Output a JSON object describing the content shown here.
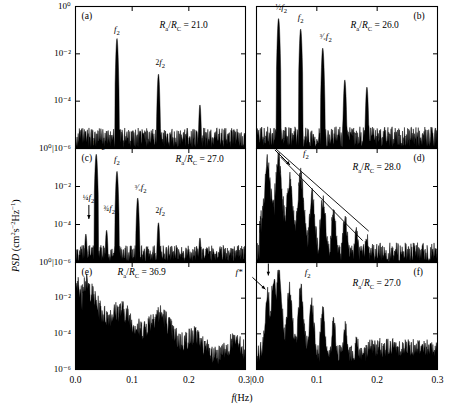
{
  "figure": {
    "axes": {
      "xlabel_italic": "f",
      "xlabel_unit": "(Hz)",
      "ylabel_italic": "PSD",
      "ylabel_unit_pre": " (cm",
      "ylabel_unit_mid": "s",
      "ylabel_unit_end": "Hz",
      "x_ticks_left": [
        "0.0",
        "0.1",
        "0.2"
      ],
      "x_tick_shared": "0.3|0.0",
      "x_ticks_right": [
        "0.1",
        "0.2",
        "0.3"
      ],
      "x_min": 0.0,
      "x_max": 0.3,
      "y_min_exp": -6,
      "y_max_exp": 0,
      "y_ticks_top": [
        "10⁰",
        "10⁻²",
        "10⁻⁴"
      ],
      "y_tick_shared": "10⁰|10⁻⁶",
      "y_ticks_bottom": [
        "10⁻²",
        "10⁻⁴",
        "10⁻⁶"
      ]
    },
    "panels": [
      {
        "id": "a",
        "letter": "(a)",
        "letter_side": "left",
        "ratio_label": "R_a/R_C = 21.0",
        "ratio_value": "21.0",
        "spectrum_type": "periodic",
        "base_frequency": 0.0732,
        "noise_floor_exp": -5.55,
        "peaks": [
          {
            "f": 0.0732,
            "exp": -1.35,
            "label": "f₂"
          },
          {
            "f": 0.1464,
            "exp": -2.85,
            "label": "2f₂"
          },
          {
            "f": 0.2196,
            "exp": -4.15,
            "label": ""
          }
        ],
        "peak_labels": [
          {
            "text_frac": "",
            "text_italic": "f",
            "text_sub": "2",
            "f": 0.0732,
            "exp": -0.95
          },
          {
            "text_frac": "2",
            "text_italic": "f",
            "text_sub": "2",
            "f": 0.1464,
            "exp": -2.35
          }
        ]
      },
      {
        "id": "b",
        "letter": "(b)",
        "letter_side": "right",
        "ratio_label": "R_a/R_C = 26.0",
        "ratio_value": "26.0",
        "spectrum_type": "period-2",
        "base_frequency": 0.0732,
        "noise_floor_exp": -5.5,
        "peaks": [
          {
            "f": 0.0366,
            "exp": -0.5,
            "label": "½f₂"
          },
          {
            "f": 0.0732,
            "exp": -0.95,
            "label": "f₂"
          },
          {
            "f": 0.1098,
            "exp": -1.75,
            "label": "³⁄₂f₂"
          },
          {
            "f": 0.1464,
            "exp": -3.1,
            "label": ""
          },
          {
            "f": 0.183,
            "exp": -3.4,
            "label": ""
          }
        ],
        "peak_labels": [
          {
            "text_frac": "½",
            "text_italic": "f",
            "text_sub": "2",
            "f": 0.0366,
            "exp": 0.0
          },
          {
            "text_frac": "",
            "text_italic": "f",
            "text_sub": "2",
            "f": 0.0732,
            "exp": -0.45
          },
          {
            "text_frac": "³⁄₂",
            "text_italic": "f",
            "text_sub": "2",
            "f": 0.1098,
            "exp": -1.25
          }
        ]
      },
      {
        "id": "c",
        "letter": "(c)",
        "letter_side": "left",
        "ratio_label": "R_a/R_C = 27.0",
        "ratio_value": "27.0",
        "spectrum_type": "period-4",
        "base_frequency": 0.0732,
        "noise_floor_exp": -5.5,
        "peaks": [
          {
            "f": 0.0183,
            "exp": -4.5,
            "label": "¼f₂"
          },
          {
            "f": 0.0366,
            "exp": -0.3,
            "label": "½f₂"
          },
          {
            "f": 0.0549,
            "exp": -4.3,
            "label": "¾f₂"
          },
          {
            "f": 0.0732,
            "exp": -1.2,
            "label": "f₂"
          },
          {
            "f": 0.1098,
            "exp": -2.6,
            "label": "³⁄₂f₂"
          },
          {
            "f": 0.1464,
            "exp": -3.9,
            "label": "2f₂"
          },
          {
            "f": 0.2196,
            "exp": -4.7,
            "label": ""
          }
        ],
        "peak_labels": [
          {
            "text_frac": "¼",
            "text_italic": "f",
            "text_sub": "2",
            "f": 0.0183,
            "exp": -2.55,
            "arrow": true
          },
          {
            "text_frac": "½",
            "text_italic": "f",
            "text_sub": "2",
            "f": 0.0366,
            "exp": 0.25
          },
          {
            "text_frac": "¾",
            "text_italic": "f",
            "text_sub": "2",
            "f": 0.0549,
            "exp": -3.15
          },
          {
            "text_frac": "",
            "text_italic": "f",
            "text_sub": "2",
            "f": 0.0732,
            "exp": -0.55
          },
          {
            "text_frac": "³⁄₂",
            "text_italic": "f",
            "text_sub": "2",
            "f": 0.1098,
            "exp": -2.0
          },
          {
            "text_frac": "2",
            "text_italic": "f",
            "text_sub": "2",
            "f": 0.1464,
            "exp": -3.25
          }
        ]
      },
      {
        "id": "d",
        "letter": "(d)",
        "letter_side": "right",
        "ratio_label": "R_a/R_C = 28.0",
        "ratio_value": "28.0",
        "spectrum_type": "chaotic-broadened",
        "base_frequency": 0.0366,
        "noise_floor_exp": -5.45,
        "peaks": [
          {
            "f": 0.0183,
            "exp": -0.7,
            "label": "¼f₂"
          },
          {
            "f": 0.0366,
            "exp": -0.5,
            "label": "½f₂"
          },
          {
            "f": 0.055,
            "exp": -1.6,
            "label": ""
          },
          {
            "f": 0.0732,
            "exp": -1.4,
            "label": "f₂"
          },
          {
            "f": 0.092,
            "exp": -2.5,
            "label": ""
          },
          {
            "f": 0.11,
            "exp": -2.7,
            "label": ""
          },
          {
            "f": 0.128,
            "exp": -3.4,
            "label": ""
          },
          {
            "f": 0.147,
            "exp": -3.7,
            "label": ""
          },
          {
            "f": 0.165,
            "exp": -4.3,
            "label": ""
          },
          {
            "f": 0.183,
            "exp": -4.6,
            "label": ""
          }
        ],
        "peak_labels": [
          {
            "text_frac": "¼",
            "text_italic": "f",
            "text_sub": "2",
            "f": 0.004,
            "exp": 0.4,
            "arrow": true
          },
          {
            "text_frac": "½",
            "text_italic": "f",
            "text_sub": "2",
            "f": 0.036,
            "exp": 0.4
          },
          {
            "text_frac": "",
            "text_italic": "f",
            "text_sub": "2",
            "f": 0.082,
            "exp": -0.25
          }
        ],
        "envelope_lines": [
          {
            "x1": 0.026,
            "y1": 0.15,
            "x2": 0.186,
            "y2": -4.35
          },
          {
            "x1": 0.04,
            "y1": -0.45,
            "x2": 0.176,
            "y2": -4.85
          }
        ]
      },
      {
        "id": "e",
        "letter": "(e)",
        "letter_side": "left",
        "ratio_label": "R_a/R_C = 36.9",
        "ratio_value": "36.9",
        "spectrum_type": "turbulent",
        "base_frequency": 0.0,
        "noise_floor_exp": -5.3,
        "peaks": [
          {
            "f": 0.04,
            "exp": -1.25,
            "label": ""
          }
        ],
        "peak_labels": []
      },
      {
        "id": "f",
        "letter": "(f)",
        "letter_side": "right",
        "ratio_label": "R_a/R_C = 27.0",
        "ratio_value": "27.0",
        "spectrum_type": "noisy-period-4",
        "base_frequency": 0.0732,
        "noise_floor_exp": -5.1,
        "peaks": [
          {
            "f": 0.0183,
            "exp": -1.7,
            "label": "¼f₂"
          },
          {
            "f": 0.0285,
            "exp": -0.9,
            "label": ""
          },
          {
            "f": 0.0366,
            "exp": -0.6,
            "label": "½f₂"
          },
          {
            "f": 0.0549,
            "exp": -1.5,
            "label": ""
          },
          {
            "f": 0.0732,
            "exp": -1.45,
            "label": "f₂"
          },
          {
            "f": 0.0915,
            "exp": -2.3,
            "label": ""
          },
          {
            "f": 0.11,
            "exp": -2.6,
            "label": ""
          },
          {
            "f": 0.128,
            "exp": -3.3,
            "label": ""
          },
          {
            "f": 0.147,
            "exp": -3.6,
            "label": ""
          },
          {
            "f": 0.166,
            "exp": -4.2,
            "label": ""
          }
        ],
        "peak_labels": [
          {
            "text_frac": "",
            "text_italic": "f*",
            "text_sub": "",
            "f": -0.03,
            "exp": -0.55,
            "arrow": true
          },
          {
            "text_frac": "¼",
            "text_italic": "f",
            "text_sub": "2",
            "f": 0.013,
            "exp": 0.45,
            "arrow": true
          },
          {
            "text_frac": "½",
            "text_italic": "f",
            "text_sub": "2",
            "f": 0.042,
            "exp": 0.45
          },
          {
            "text_frac": "",
            "text_italic": "f",
            "text_sub": "2",
            "f": 0.085,
            "exp": -0.55
          }
        ]
      }
    ]
  },
  "chart_data": {
    "type": "line",
    "title": "",
    "xlabel": "f (Hz)",
    "ylabel": "PSD (cm2 s-2 Hz-1)",
    "xlim": [
      0.0,
      0.3
    ],
    "ylim_log10": [
      -6,
      0
    ],
    "x_scale": "linear",
    "y_scale": "log",
    "grid": false,
    "legend": "none",
    "panel_count": 6,
    "panel_layout": "3 rows x 2 columns",
    "series": [
      {
        "name": "(a) Ra/Rc = 21.0",
        "description": "Single limit-cycle spectrum: sharp fundamental f2 with harmonics over flat noise floor",
        "noise_floor_log10": -5.55,
        "peak_frequencies_hz": [
          0.0732,
          0.1464,
          0.2196
        ],
        "peak_values_log10": [
          -1.35,
          -2.85,
          -4.15
        ],
        "labelled_peaks": [
          "f2",
          "2f2"
        ]
      },
      {
        "name": "(b) Ra/Rc = 26.0",
        "description": "Period-doubled spectrum: subharmonic 1/2 f2 appears, largest peak",
        "noise_floor_log10": -5.5,
        "peak_frequencies_hz": [
          0.0366,
          0.0732,
          0.1098,
          0.1464,
          0.183
        ],
        "peak_values_log10": [
          -0.5,
          -0.95,
          -1.75,
          -3.1,
          -3.4
        ],
        "labelled_peaks": [
          "1/2 f2",
          "f2",
          "3/2 f2"
        ]
      },
      {
        "name": "(c) Ra/Rc = 27.0",
        "description": "Period-4 spectrum: quarter subharmonics 1/4 f2 and 3/4 f2 present",
        "noise_floor_log10": -5.5,
        "peak_frequencies_hz": [
          0.0183,
          0.0366,
          0.0549,
          0.0732,
          0.1098,
          0.1464,
          0.2196
        ],
        "peak_values_log10": [
          -4.5,
          -0.3,
          -4.3,
          -1.2,
          -2.6,
          -3.9,
          -4.7
        ],
        "labelled_peaks": [
          "1/4 f2",
          "1/2 f2",
          "3/4 f2",
          "f2",
          "3/2 f2",
          "2f2"
        ]
      },
      {
        "name": "(d) Ra/Rc = 28.0",
        "description": "Chaotic: broadened peaks with two straight descending envelope lines",
        "noise_floor_log10": -5.45,
        "peak_frequencies_hz": [
          0.0183,
          0.0366,
          0.055,
          0.0732,
          0.092,
          0.11,
          0.128,
          0.147,
          0.165,
          0.183
        ],
        "peak_values_log10": [
          -0.7,
          -0.5,
          -1.6,
          -1.4,
          -2.5,
          -2.7,
          -3.4,
          -3.7,
          -4.3,
          -4.6
        ],
        "labelled_peaks": [
          "1/4 f2",
          "1/2 f2",
          "f2"
        ]
      },
      {
        "name": "(e) Ra/Rc = 36.9",
        "description": "Fully turbulent: broadband spectrum decaying monotonically, no discrete peaks",
        "noise_floor_log10": -5.3,
        "peak_frequencies_hz": [
          0.04
        ],
        "peak_values_log10": [
          -1.25
        ],
        "labelled_peaks": []
      },
      {
        "name": "(f) Ra/Rc = 27.0",
        "description": "Noisy period-4 with extra incommensurate frequency f*",
        "noise_floor_log10": -5.1,
        "peak_frequencies_hz": [
          0.0183,
          0.0285,
          0.0366,
          0.0549,
          0.0732,
          0.0915,
          0.11,
          0.128,
          0.147,
          0.166
        ],
        "peak_values_log10": [
          -1.7,
          -0.9,
          -0.6,
          -1.5,
          -1.45,
          -2.3,
          -2.6,
          -3.3,
          -3.6,
          -4.2
        ],
        "labelled_peaks": [
          "f*",
          "1/4 f2",
          "1/2 f2",
          "f2"
        ]
      }
    ]
  }
}
